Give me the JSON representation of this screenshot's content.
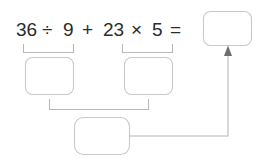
{
  "worksheet": {
    "title": "Order of operations step boxes",
    "background_color": "#ffffff",
    "line_color": "#b8b8b8",
    "box_border_color": "#c9c9c9",
    "text_color": "#2b2b2b",
    "arrow_color": "#6e6e6e"
  },
  "equation": {
    "full_text": "36 ÷ 9 + 23 × 5 =",
    "tokens": [
      {
        "text": "36",
        "kind": "number"
      },
      {
        "text": "÷",
        "kind": "operator"
      },
      {
        "text": "9",
        "kind": "number"
      },
      {
        "text": "+",
        "kind": "operator"
      },
      {
        "text": "23",
        "kind": "number"
      },
      {
        "text": "×",
        "kind": "operator"
      },
      {
        "text": "5",
        "kind": "number"
      },
      {
        "text": "=",
        "kind": "operator"
      }
    ]
  },
  "answer_boxes": {
    "result": {
      "value": "",
      "placeholder": ""
    },
    "step_left": {
      "value": "",
      "placeholder": ""
    },
    "step_right": {
      "value": "",
      "placeholder": ""
    },
    "step_sum": {
      "value": "",
      "placeholder": ""
    }
  },
  "groupings": [
    {
      "name": "division-group",
      "covers": "36 ÷ 9"
    },
    {
      "name": "multiplication-group",
      "covers": "23 × 5"
    },
    {
      "name": "addition-group",
      "covers": "step_left + step_right"
    }
  ],
  "connectors": [
    {
      "name": "sum-to-result-arrow",
      "from": "step_sum",
      "to": "result"
    }
  ]
}
